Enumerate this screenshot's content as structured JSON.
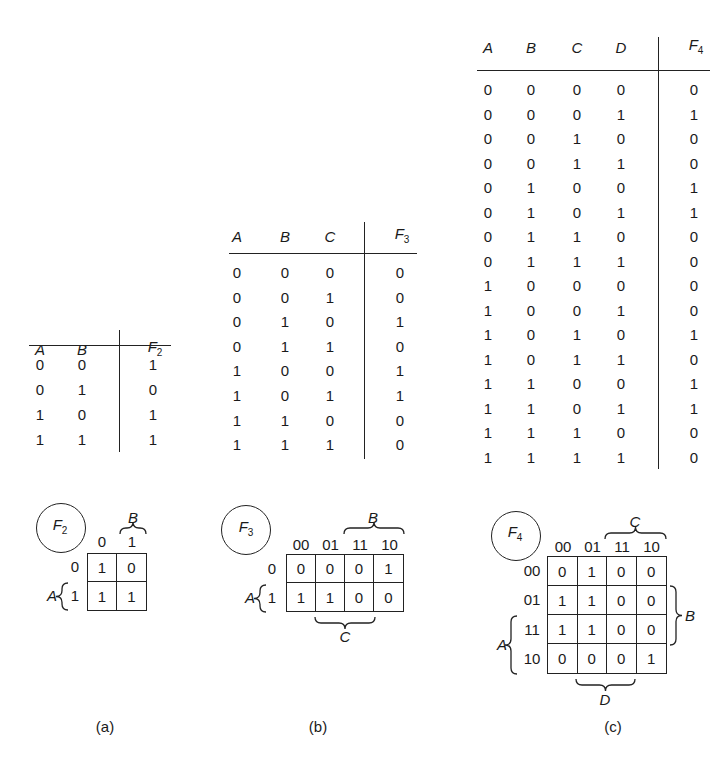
{
  "figure": {
    "panels": [
      {
        "id": "a",
        "caption": "(a)",
        "truth_table": {
          "headers": [
            "A",
            "B"
          ],
          "output": {
            "name": "F",
            "sub": "2"
          },
          "rows": [
            {
              "inputs": [
                "0",
                "0"
              ],
              "out": "1"
            },
            {
              "inputs": [
                "0",
                "1"
              ],
              "out": "0"
            },
            {
              "inputs": [
                "1",
                "0"
              ],
              "out": "1"
            },
            {
              "inputs": [
                "1",
                "1"
              ],
              "out": "1"
            }
          ]
        },
        "kmap": {
          "label": {
            "name": "F",
            "sub": "2"
          },
          "col_var": "B",
          "row_var": "A",
          "col_labels": [
            "0",
            "1"
          ],
          "row_labels": [
            "0",
            "1"
          ],
          "cells": [
            [
              "1",
              "0"
            ],
            [
              "1",
              "1"
            ]
          ]
        }
      },
      {
        "id": "b",
        "caption": "(b)",
        "truth_table": {
          "headers": [
            "A",
            "B",
            "C"
          ],
          "output": {
            "name": "F",
            "sub": "3"
          },
          "rows": [
            {
              "inputs": [
                "0",
                "0",
                "0"
              ],
              "out": "0"
            },
            {
              "inputs": [
                "0",
                "0",
                "1"
              ],
              "out": "0"
            },
            {
              "inputs": [
                "0",
                "1",
                "0"
              ],
              "out": "1"
            },
            {
              "inputs": [
                "0",
                "1",
                "1"
              ],
              "out": "0"
            },
            {
              "inputs": [
                "1",
                "0",
                "0"
              ],
              "out": "1"
            },
            {
              "inputs": [
                "1",
                "0",
                "1"
              ],
              "out": "1"
            },
            {
              "inputs": [
                "1",
                "1",
                "0"
              ],
              "out": "0"
            },
            {
              "inputs": [
                "1",
                "1",
                "1"
              ],
              "out": "0"
            }
          ]
        },
        "kmap": {
          "label": {
            "name": "F",
            "sub": "3"
          },
          "top_var": "B",
          "bottom_var": "C",
          "row_var": "A",
          "col_labels": [
            "00",
            "01",
            "11",
            "10"
          ],
          "row_labels": [
            "0",
            "1"
          ],
          "cells": [
            [
              "0",
              "0",
              "0",
              "1"
            ],
            [
              "1",
              "1",
              "0",
              "0"
            ]
          ]
        }
      },
      {
        "id": "c",
        "caption": "(c)",
        "truth_table": {
          "headers": [
            "A",
            "B",
            "C",
            "D"
          ],
          "output": {
            "name": "F",
            "sub": "4"
          },
          "rows": [
            {
              "inputs": [
                "0",
                "0",
                "0",
                "0"
              ],
              "out": "0"
            },
            {
              "inputs": [
                "0",
                "0",
                "0",
                "1"
              ],
              "out": "1"
            },
            {
              "inputs": [
                "0",
                "0",
                "1",
                "0"
              ],
              "out": "0"
            },
            {
              "inputs": [
                "0",
                "0",
                "1",
                "1"
              ],
              "out": "0"
            },
            {
              "inputs": [
                "0",
                "1",
                "0",
                "0"
              ],
              "out": "1"
            },
            {
              "inputs": [
                "0",
                "1",
                "0",
                "1"
              ],
              "out": "1"
            },
            {
              "inputs": [
                "0",
                "1",
                "1",
                "0"
              ],
              "out": "0"
            },
            {
              "inputs": [
                "0",
                "1",
                "1",
                "1"
              ],
              "out": "0"
            },
            {
              "inputs": [
                "1",
                "0",
                "0",
                "0"
              ],
              "out": "0"
            },
            {
              "inputs": [
                "1",
                "0",
                "0",
                "1"
              ],
              "out": "0"
            },
            {
              "inputs": [
                "1",
                "0",
                "1",
                "0"
              ],
              "out": "1"
            },
            {
              "inputs": [
                "1",
                "0",
                "1",
                "1"
              ],
              "out": "0"
            },
            {
              "inputs": [
                "1",
                "1",
                "0",
                "0"
              ],
              "out": "1"
            },
            {
              "inputs": [
                "1",
                "1",
                "0",
                "1"
              ],
              "out": "1"
            },
            {
              "inputs": [
                "1",
                "1",
                "1",
                "0"
              ],
              "out": "0"
            },
            {
              "inputs": [
                "1",
                "1",
                "1",
                "1"
              ],
              "out": "0"
            }
          ]
        },
        "kmap": {
          "label": {
            "name": "F",
            "sub": "4"
          },
          "top_var": "C",
          "bottom_var": "D",
          "right_var": "B",
          "left_var": "A",
          "col_labels": [
            "00",
            "01",
            "11",
            "10"
          ],
          "row_labels": [
            "00",
            "01",
            "11",
            "10"
          ],
          "cells": [
            [
              "0",
              "1",
              "0",
              "0"
            ],
            [
              "1",
              "1",
              "0",
              "0"
            ],
            [
              "1",
              "1",
              "0",
              "0"
            ],
            [
              "0",
              "0",
              "0",
              "1"
            ]
          ]
        }
      }
    ]
  }
}
